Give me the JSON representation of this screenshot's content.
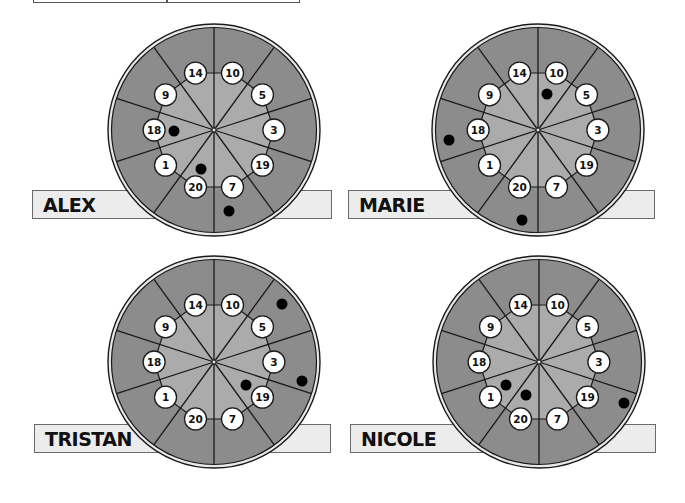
{
  "colors": {
    "outer_ring": "#8c8c8c",
    "inner_area": "#ababab",
    "rim_light": "#e8e8e8",
    "line": "#1a1a1a",
    "bubble": "#ffffff",
    "dot": "#000000",
    "label_bar": "#ececec"
  },
  "target": {
    "sector_count": 10,
    "numbers_clockwise_from_top": [
      "10",
      "5",
      "3",
      "19",
      "7",
      "20",
      "1",
      "18",
      "9",
      "14"
    ]
  },
  "players": [
    {
      "name": "ALEX",
      "circle": {
        "cx": 214,
        "cy": 130,
        "r": 106
      },
      "bar": {
        "x": 32,
        "y": 190,
        "w": 300,
        "h": 29
      },
      "hits": [
        [
          174,
          131
        ],
        [
          201,
          169
        ],
        [
          229,
          211
        ]
      ]
    },
    {
      "name": "MARIE",
      "circle": {
        "cx": 538,
        "cy": 130,
        "r": 106
      },
      "bar": {
        "x": 348,
        "y": 190,
        "w": 307,
        "h": 29
      },
      "hits": [
        [
          547,
          94
        ],
        [
          449,
          140
        ],
        [
          522,
          220
        ]
      ]
    },
    {
      "name": "TRISTAN",
      "circle": {
        "cx": 214,
        "cy": 362,
        "r": 106
      },
      "bar": {
        "x": 34,
        "y": 424,
        "w": 297,
        "h": 29
      },
      "hits": [
        [
          282,
          304
        ],
        [
          302,
          381
        ],
        [
          246,
          385
        ]
      ]
    },
    {
      "name": "NICOLE",
      "circle": {
        "cx": 539,
        "cy": 362,
        "r": 106
      },
      "bar": {
        "x": 350,
        "y": 424,
        "w": 306,
        "h": 29
      },
      "hits": [
        [
          506,
          385
        ],
        [
          526,
          395
        ],
        [
          624,
          403
        ]
      ]
    }
  ]
}
